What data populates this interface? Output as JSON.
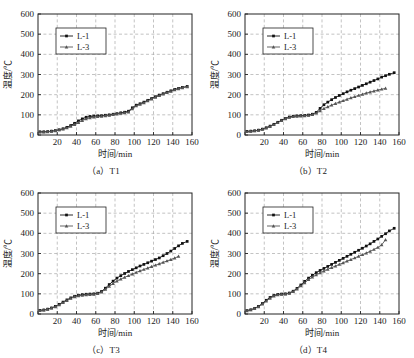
{
  "figure": {
    "panel_count": 4,
    "axis": {
      "xlabel": "时间/min",
      "ylabel": "温度/℃",
      "xticks": [
        0,
        20,
        40,
        60,
        80,
        100,
        120,
        140,
        160
      ],
      "xtick_labels": [
        "",
        "20",
        "40",
        "60",
        "80",
        "100",
        "120",
        "140",
        "160"
      ],
      "yticks": [
        0,
        100,
        200,
        300,
        400,
        500,
        600
      ],
      "ytick_labels": [
        "0",
        "100",
        "200",
        "300",
        "400",
        "500",
        "600"
      ],
      "xlim": [
        0,
        160
      ],
      "ylim": [
        0,
        600
      ],
      "grid": "dashed-gray-both-axes"
    },
    "legend": {
      "position": "upper-left-inside",
      "entries": [
        {
          "label": "L-1",
          "marker": "square",
          "color": "#111111"
        },
        {
          "label": "L-3",
          "marker": "triangle",
          "color": "#4a4a4a"
        }
      ]
    },
    "colors": {
      "series_l1": "#111111",
      "series_l3": "#555555",
      "grid": "#9a9a9a",
      "frame": "#222222",
      "background": "#ffffff"
    },
    "captions": [
      "（a）T1",
      "（b）T2",
      "（c）T3",
      "（d）T4"
    ]
  },
  "chart_data": [
    {
      "type": "line",
      "title": "（a）T1",
      "xlabel": "时间/min",
      "ylabel": "温度/℃",
      "xlim": [
        0,
        160
      ],
      "ylim": [
        0,
        600
      ],
      "grid": true,
      "legend": "upper left",
      "series": [
        {
          "name": "L-1",
          "marker": "square",
          "x": [
            2,
            6,
            10,
            14,
            18,
            22,
            26,
            30,
            34,
            38,
            42,
            46,
            50,
            54,
            58,
            62,
            66,
            70,
            74,
            78,
            82,
            86,
            90,
            94,
            98,
            102,
            106,
            110,
            114,
            118,
            122,
            126,
            130,
            134,
            138,
            142,
            146,
            150,
            155
          ],
          "y": [
            16,
            16,
            17,
            19,
            22,
            26,
            31,
            38,
            47,
            58,
            70,
            80,
            88,
            92,
            94,
            95,
            96,
            98,
            100,
            103,
            106,
            110,
            113,
            118,
            135,
            148,
            155,
            163,
            172,
            181,
            190,
            198,
            205,
            212,
            219,
            226,
            231,
            236,
            241
          ]
        },
        {
          "name": "L-3",
          "marker": "triangle",
          "x": [
            2,
            6,
            10,
            14,
            18,
            22,
            26,
            30,
            34,
            38,
            42,
            46,
            50,
            54,
            58,
            62,
            66,
            70,
            74,
            78,
            82,
            86,
            90,
            94,
            98,
            102,
            106,
            110,
            114,
            118,
            122,
            126,
            130,
            134,
            138,
            142,
            146,
            150,
            155
          ],
          "y": [
            15,
            15,
            16,
            18,
            21,
            25,
            29,
            35,
            43,
            52,
            62,
            72,
            80,
            85,
            89,
            91,
            93,
            95,
            98,
            101,
            104,
            107,
            110,
            114,
            130,
            144,
            152,
            160,
            169,
            178,
            187,
            195,
            203,
            210,
            217,
            224,
            229,
            234,
            239
          ]
        }
      ]
    },
    {
      "type": "line",
      "title": "（b）T2",
      "xlabel": "时间/min",
      "ylabel": "温度/℃",
      "xlim": [
        0,
        160
      ],
      "ylim": [
        0,
        600
      ],
      "grid": true,
      "legend": "upper left",
      "series": [
        {
          "name": "L-1",
          "marker": "square",
          "x": [
            2,
            6,
            10,
            14,
            18,
            22,
            26,
            30,
            34,
            38,
            42,
            46,
            50,
            54,
            58,
            62,
            66,
            70,
            74,
            78,
            82,
            86,
            90,
            94,
            98,
            102,
            106,
            110,
            114,
            118,
            122,
            126,
            130,
            134,
            138,
            142,
            146,
            150,
            155
          ],
          "y": [
            18,
            19,
            21,
            24,
            29,
            36,
            44,
            53,
            63,
            73,
            82,
            89,
            93,
            95,
            96,
            97,
            99,
            103,
            112,
            132,
            150,
            163,
            175,
            186,
            196,
            205,
            214,
            222,
            230,
            238,
            246,
            254,
            262,
            270,
            278,
            287,
            294,
            301,
            309
          ]
        },
        {
          "name": "L-3",
          "marker": "triangle",
          "x": [
            2,
            6,
            10,
            14,
            18,
            22,
            26,
            30,
            34,
            38,
            42,
            46,
            50,
            54,
            58,
            62,
            66,
            70,
            74,
            78,
            82,
            86,
            90,
            94,
            98,
            102,
            106,
            110,
            114,
            118,
            122,
            126,
            130,
            134,
            138,
            142,
            146
          ],
          "y": [
            17,
            18,
            20,
            23,
            28,
            34,
            42,
            51,
            61,
            71,
            80,
            87,
            91,
            93,
            94,
            95,
            97,
            101,
            108,
            120,
            131,
            140,
            148,
            156,
            163,
            170,
            177,
            184,
            190,
            196,
            202,
            208,
            213,
            218,
            223,
            227,
            231
          ]
        }
      ]
    },
    {
      "type": "line",
      "title": "（c）T3",
      "xlabel": "时间/min",
      "ylabel": "温度/℃",
      "xlim": [
        0,
        160
      ],
      "ylim": [
        0,
        600
      ],
      "grid": true,
      "legend": "upper left",
      "series": [
        {
          "name": "L-1",
          "marker": "square",
          "x": [
            2,
            6,
            10,
            14,
            18,
            22,
            26,
            30,
            34,
            38,
            42,
            46,
            50,
            54,
            58,
            62,
            66,
            70,
            74,
            78,
            82,
            86,
            90,
            94,
            98,
            102,
            106,
            110,
            114,
            118,
            122,
            126,
            130,
            134,
            138,
            142,
            146,
            150,
            155
          ],
          "y": [
            18,
            20,
            24,
            30,
            38,
            48,
            59,
            70,
            80,
            88,
            93,
            96,
            98,
            99,
            100,
            103,
            112,
            128,
            146,
            163,
            178,
            190,
            201,
            211,
            220,
            229,
            238,
            246,
            254,
            262,
            270,
            278,
            289,
            300,
            312,
            325,
            338,
            350,
            360
          ]
        },
        {
          "name": "L-3",
          "marker": "triangle",
          "x": [
            2,
            6,
            10,
            14,
            18,
            22,
            26,
            30,
            34,
            38,
            42,
            46,
            50,
            54,
            58,
            62,
            66,
            70,
            74,
            78,
            82,
            86,
            90,
            94,
            98,
            102,
            106,
            110,
            114,
            118,
            122,
            126,
            130,
            134,
            138,
            142,
            146
          ],
          "y": [
            17,
            19,
            23,
            29,
            36,
            45,
            56,
            67,
            77,
            85,
            90,
            93,
            95,
            96,
            98,
            101,
            109,
            122,
            137,
            151,
            163,
            173,
            182,
            190,
            198,
            206,
            214,
            221,
            228,
            235,
            242,
            249,
            256,
            263,
            270,
            277,
            286
          ]
        }
      ]
    },
    {
      "type": "line",
      "title": "（d）T4",
      "xlabel": "时间/min",
      "ylabel": "温度/℃",
      "xlim": [
        0,
        160
      ],
      "ylim": [
        0,
        600
      ],
      "grid": true,
      "legend": "upper left",
      "series": [
        {
          "name": "L-1",
          "marker": "square",
          "x": [
            2,
            6,
            10,
            14,
            18,
            22,
            26,
            30,
            34,
            38,
            42,
            46,
            50,
            54,
            58,
            62,
            66,
            70,
            74,
            78,
            82,
            86,
            90,
            94,
            98,
            102,
            106,
            110,
            114,
            118,
            122,
            126,
            130,
            134,
            138,
            142,
            146,
            150,
            155
          ],
          "y": [
            17,
            21,
            28,
            38,
            52,
            68,
            82,
            92,
            97,
            99,
            100,
            104,
            113,
            127,
            144,
            162,
            178,
            192,
            205,
            216,
            226,
            236,
            246,
            256,
            266,
            276,
            286,
            296,
            306,
            316,
            326,
            337,
            348,
            360,
            372,
            385,
            398,
            412,
            425
          ]
        },
        {
          "name": "L-3",
          "marker": "triangle",
          "x": [
            2,
            6,
            10,
            14,
            18,
            22,
            26,
            30,
            34,
            38,
            42,
            46,
            50,
            54,
            58,
            62,
            66,
            70,
            74,
            78,
            82,
            86,
            90,
            94,
            98,
            102,
            106,
            110,
            114,
            118,
            122,
            126,
            130,
            134,
            138,
            142,
            146
          ],
          "y": [
            16,
            20,
            27,
            36,
            49,
            64,
            78,
            89,
            95,
            97,
            99,
            103,
            111,
            124,
            139,
            155,
            170,
            183,
            194,
            204,
            213,
            222,
            230,
            238,
            246,
            254,
            262,
            270,
            278,
            286,
            294,
            302,
            311,
            320,
            330,
            343,
            368
          ]
        }
      ]
    }
  ]
}
